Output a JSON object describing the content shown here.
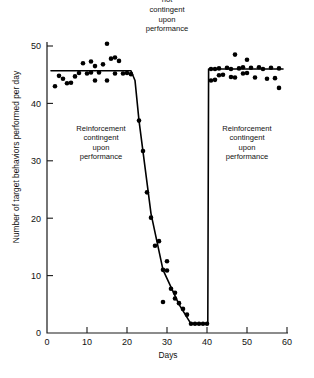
{
  "chart_data": {
    "type": "scatter",
    "title": "",
    "xlabel": "Days",
    "ylabel": "Number of target behaviors performed per day",
    "xlim": [
      0,
      60
    ],
    "ylim": [
      0,
      52
    ],
    "xticks": [
      0,
      10,
      20,
      30,
      40,
      50,
      60
    ],
    "yticks": [
      0,
      10,
      20,
      30,
      40,
      50
    ],
    "xticklabels": [
      "0",
      "10",
      "20",
      "30",
      "40",
      "50",
      "60"
    ],
    "yticklabels": [
      "0",
      "10",
      "20",
      "30",
      "40",
      "50"
    ],
    "grid": false,
    "legend": null,
    "series": [
      {
        "name": "Target behaviors per day",
        "marker": "filled-circle",
        "points": [
          [
            2,
            43.0
          ],
          [
            3,
            44.8
          ],
          [
            4,
            44.3
          ],
          [
            5,
            43.5
          ],
          [
            6,
            43.6
          ],
          [
            7,
            44.7
          ],
          [
            8,
            45.3
          ],
          [
            9,
            47.0
          ],
          [
            10,
            45.2
          ],
          [
            11,
            45.4
          ],
          [
            11,
            47.3
          ],
          [
            12,
            46.5
          ],
          [
            12,
            44.0
          ],
          [
            13,
            45.4
          ],
          [
            14,
            46.8
          ],
          [
            15,
            50.4
          ],
          [
            15,
            44.0
          ],
          [
            16,
            47.8
          ],
          [
            17,
            45.2
          ],
          [
            17,
            48.0
          ],
          [
            18,
            47.4
          ],
          [
            19,
            45.2
          ],
          [
            20,
            45.3
          ],
          [
            21,
            45.1
          ],
          [
            23,
            37.0
          ],
          [
            24,
            31.7
          ],
          [
            25,
            24.5
          ],
          [
            26,
            20.1
          ],
          [
            27,
            15.2
          ],
          [
            28,
            16.0
          ],
          [
            29,
            11.0
          ],
          [
            29,
            5.4
          ],
          [
            30,
            12.5
          ],
          [
            30,
            10.9
          ],
          [
            31,
            7.7
          ],
          [
            32,
            7.0
          ],
          [
            32,
            6.0
          ],
          [
            33,
            5.2
          ],
          [
            34,
            4.2
          ],
          [
            35,
            3.2
          ],
          [
            36,
            1.6
          ],
          [
            37,
            1.6
          ],
          [
            38,
            1.6
          ],
          [
            39,
            1.6
          ],
          [
            40,
            1.6
          ],
          [
            41,
            46.0
          ],
          [
            41,
            44.0
          ],
          [
            42,
            46.0
          ],
          [
            42,
            44.1
          ],
          [
            43,
            46.1
          ],
          [
            43,
            44.9
          ],
          [
            44,
            45.0
          ],
          [
            45,
            46.2
          ],
          [
            46,
            46.0
          ],
          [
            46,
            44.6
          ],
          [
            47,
            48.5
          ],
          [
            47,
            44.5
          ],
          [
            48,
            46.1
          ],
          [
            49,
            46.3
          ],
          [
            49,
            45.2
          ],
          [
            50,
            47.6
          ],
          [
            50,
            45.3
          ],
          [
            51,
            46.2
          ],
          [
            52,
            44.5
          ],
          [
            53,
            46.3
          ],
          [
            54,
            46.0
          ],
          [
            55,
            44.3
          ],
          [
            56,
            46.2
          ],
          [
            57,
            44.4
          ],
          [
            58,
            46.1
          ],
          [
            58,
            42.7
          ]
        ]
      }
    ],
    "trend_line": {
      "name": "fitted-phase-line",
      "points": [
        [
          1,
          45.7
        ],
        [
          21,
          45.7
        ],
        [
          22,
          44.0
        ],
        [
          23,
          37.0
        ],
        [
          26,
          20.8
        ],
        [
          29,
          11.0
        ],
        [
          33,
          5.0
        ],
        [
          36,
          1.6
        ],
        [
          40.2,
          1.6
        ],
        [
          40.4,
          46.0
        ],
        [
          59,
          46.0
        ]
      ]
    },
    "phase_labels": [
      {
        "id": "phase-1",
        "text": "Reinforcement\ncontingent\nupon\nperformance",
        "x_days_center": 13.5,
        "y_value_center": 33
      },
      {
        "id": "phase-2",
        "text": "Reinforcement\nnot\ncontingent\nupon\nperformance",
        "x_days_center": 30,
        "y_value_center": 57
      },
      {
        "id": "phase-3",
        "text": "Reinforcement\ncontingent\nupon\nperformance",
        "x_days_center": 50,
        "y_value_center": 33
      }
    ]
  },
  "axes": {
    "x_title": "Days",
    "y_title": "Number of target behaviors performed per day"
  },
  "annotations": {
    "phase1": "Reinforcement\ncontingent\nupon\nperformance",
    "phase2": "Reinforcement\nnot\ncontingent\nupon\nperformance",
    "phase3": "Reinforcement\ncontingent\nupon\nperformance"
  },
  "colors": {
    "ink": "#111111",
    "point": "#000000",
    "background": "#ffffff"
  }
}
